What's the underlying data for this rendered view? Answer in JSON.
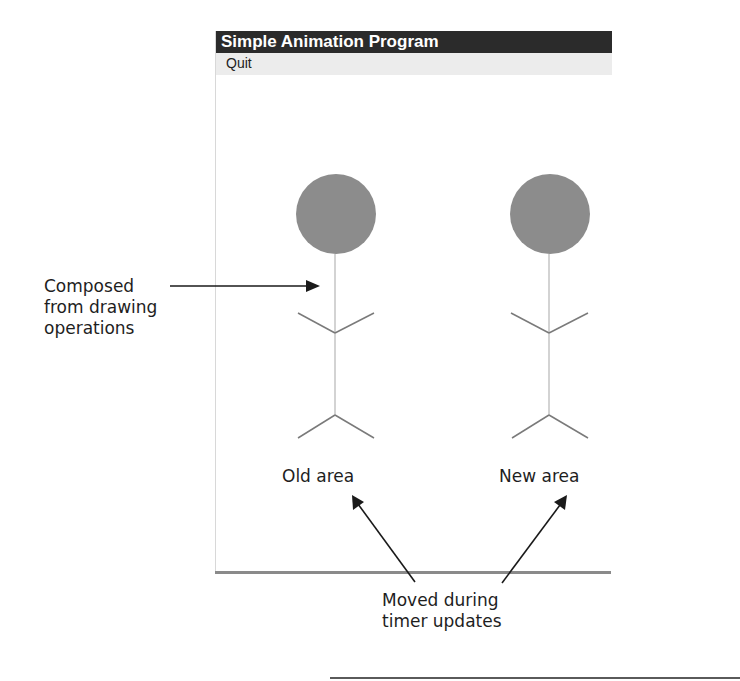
{
  "window": {
    "title": "Simple Animation Program",
    "menu": [
      {
        "label": "Quit"
      }
    ],
    "colors": {
      "titlebar": "#2b2b2b",
      "menubar": "#ececec",
      "head": "#8c8c8c",
      "body_lines": "#b8b8b8",
      "limbs": "#7a7a7a"
    }
  },
  "figures": [
    {
      "name": "old",
      "label": "Old area"
    },
    {
      "name": "new",
      "label": "New area"
    }
  ],
  "annotations": {
    "composed": {
      "lines": [
        "Composed",
        "from drawing",
        "operations"
      ]
    },
    "moved": {
      "lines": [
        "Moved during",
        "timer updates"
      ]
    }
  }
}
